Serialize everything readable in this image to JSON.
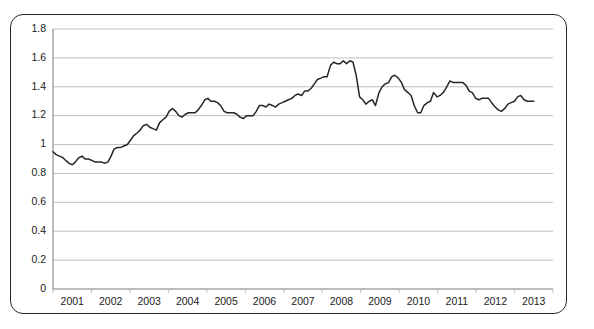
{
  "chart_data": {
    "type": "line",
    "title": "",
    "subtitle": "",
    "xlabel": "",
    "ylabel": "",
    "grid": true,
    "legend": "none",
    "xlim": [
      2001,
      2013.45
    ],
    "ylim": [
      0,
      1.8
    ],
    "ytick_labels": [
      "1.8",
      "1.6",
      "1.4",
      "1.2",
      "1",
      "0.8",
      "0.6",
      "0.4",
      "0.2",
      "0"
    ],
    "ytick_values": [
      1.8,
      1.6,
      1.4,
      1.2,
      1.0,
      0.8,
      0.6,
      0.4,
      0.2,
      0
    ],
    "xtick_labels": [
      "2001",
      "2002",
      "2003",
      "2004",
      "2005",
      "2006",
      "2007",
      "2008",
      "2009",
      "2010",
      "2011",
      "2012",
      "2013"
    ],
    "xtick_values": [
      2001,
      2002,
      2003,
      2004,
      2005,
      2006,
      2007,
      2008,
      2009,
      2010,
      2011,
      2012,
      2013
    ],
    "series": [
      {
        "name": "Exchange rate",
        "color": "#262626",
        "x": [
          2001.0,
          2001.08,
          2001.17,
          2001.25,
          2001.33,
          2001.42,
          2001.5,
          2001.58,
          2001.67,
          2001.75,
          2001.83,
          2001.92,
          2002.0,
          2002.08,
          2002.17,
          2002.25,
          2002.33,
          2002.42,
          2002.5,
          2002.58,
          2002.67,
          2002.75,
          2002.83,
          2002.92,
          2003.0,
          2003.08,
          2003.17,
          2003.25,
          2003.33,
          2003.42,
          2003.5,
          2003.58,
          2003.67,
          2003.75,
          2003.83,
          2003.92,
          2004.0,
          2004.08,
          2004.17,
          2004.25,
          2004.33,
          2004.42,
          2004.5,
          2004.58,
          2004.67,
          2004.75,
          2004.83,
          2004.92,
          2005.0,
          2005.08,
          2005.17,
          2005.25,
          2005.33,
          2005.42,
          2005.5,
          2005.58,
          2005.67,
          2005.75,
          2005.83,
          2005.92,
          2006.0,
          2006.08,
          2006.17,
          2006.25,
          2006.33,
          2006.42,
          2006.5,
          2006.58,
          2006.67,
          2006.75,
          2006.83,
          2006.92,
          2007.0,
          2007.08,
          2007.17,
          2007.25,
          2007.33,
          2007.42,
          2007.5,
          2007.58,
          2007.67,
          2007.75,
          2007.83,
          2007.92,
          2008.0,
          2008.08,
          2008.17,
          2008.25,
          2008.33,
          2008.42,
          2008.5,
          2008.58,
          2008.67,
          2008.75,
          2008.83,
          2008.92,
          2009.0,
          2009.08,
          2009.17,
          2009.25,
          2009.33,
          2009.42,
          2009.5,
          2009.58,
          2009.67,
          2009.75,
          2009.83,
          2009.92,
          2010.0,
          2010.08,
          2010.17,
          2010.25,
          2010.33,
          2010.42,
          2010.5,
          2010.58,
          2010.67,
          2010.75,
          2010.83,
          2010.92,
          2011.0,
          2011.08,
          2011.17,
          2011.25,
          2011.33,
          2011.42,
          2011.5,
          2011.58,
          2011.67,
          2011.75,
          2011.83,
          2011.92,
          2012.0,
          2012.08,
          2012.17,
          2012.25,
          2012.33,
          2012.42,
          2012.5,
          2012.58,
          2012.67,
          2012.75,
          2012.83,
          2012.92,
          2013.0,
          2013.08,
          2013.17,
          2013.25,
          2013.33,
          2013.42
        ],
        "values": [
          0.95,
          0.93,
          0.92,
          0.91,
          0.89,
          0.87,
          0.86,
          0.88,
          0.91,
          0.92,
          0.9,
          0.9,
          0.89,
          0.88,
          0.88,
          0.88,
          0.87,
          0.88,
          0.92,
          0.97,
          0.98,
          0.98,
          0.99,
          1.0,
          1.03,
          1.06,
          1.08,
          1.1,
          1.13,
          1.14,
          1.12,
          1.11,
          1.1,
          1.15,
          1.17,
          1.19,
          1.23,
          1.25,
          1.23,
          1.2,
          1.19,
          1.21,
          1.22,
          1.22,
          1.22,
          1.24,
          1.27,
          1.31,
          1.32,
          1.3,
          1.3,
          1.29,
          1.27,
          1.23,
          1.22,
          1.22,
          1.22,
          1.21,
          1.19,
          1.18,
          1.2,
          1.2,
          1.2,
          1.23,
          1.27,
          1.27,
          1.26,
          1.28,
          1.27,
          1.26,
          1.28,
          1.29,
          1.3,
          1.31,
          1.32,
          1.34,
          1.35,
          1.34,
          1.37,
          1.37,
          1.39,
          1.42,
          1.45,
          1.46,
          1.47,
          1.47,
          1.55,
          1.57,
          1.56,
          1.56,
          1.58,
          1.56,
          1.58,
          1.57,
          1.48,
          1.33,
          1.31,
          1.28,
          1.3,
          1.31,
          1.27,
          1.36,
          1.4,
          1.42,
          1.43,
          1.47,
          1.48,
          1.46,
          1.43,
          1.38,
          1.36,
          1.34,
          1.27,
          1.22,
          1.22,
          1.27,
          1.29,
          1.3,
          1.36,
          1.33,
          1.34,
          1.36,
          1.4,
          1.44,
          1.43,
          1.43,
          1.43,
          1.43,
          1.41,
          1.37,
          1.36,
          1.32,
          1.31,
          1.32,
          1.32,
          1.32,
          1.29,
          1.26,
          1.24,
          1.23,
          1.25,
          1.28,
          1.29,
          1.3,
          1.33,
          1.34,
          1.31,
          1.3,
          1.3,
          1.3
        ]
      }
    ]
  },
  "geometry": {
    "plot_left": 53,
    "plot_right": 553,
    "plot_top": 29,
    "plot_bottom": 289,
    "x_data_right": 535
  },
  "style": {
    "frame_color": "#2b2b2b",
    "grid_color": "#b9b9b9",
    "axis_color": "#7a7a7a",
    "line_color": "#262626",
    "text_color": "#1c1c1c",
    "background": "#ffffff"
  }
}
